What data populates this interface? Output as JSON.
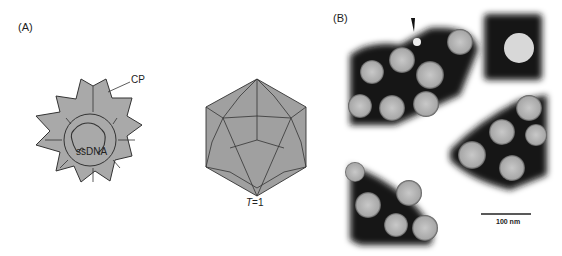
{
  "figure": {
    "panels": [
      {
        "id": "A",
        "label": "(A)",
        "schematic": {
          "cross_section": {
            "label_cp": "CP",
            "label_genome": "ssDNA",
            "fill_color": "#a9a9a9",
            "stroke_color": "#333333"
          },
          "icosahedron": {
            "label_prefix": "T",
            "label_suffix": "=1",
            "fill_color": "#a0a0a0",
            "stroke_color": "#333333"
          }
        }
      },
      {
        "id": "B",
        "label": "(B)",
        "micrograph": {
          "description": "negative-stain electron micrograph of virus particles",
          "arrowhead": "arrowhead-marker",
          "scale_bar_label": "100 nm",
          "background_color": "#ffffff",
          "stain_color": "#141414",
          "particle_color": "#b8b8b8"
        }
      }
    ]
  }
}
